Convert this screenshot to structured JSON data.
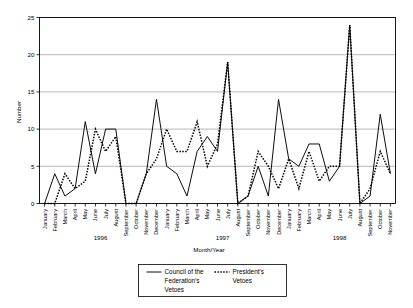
{
  "chart_data": {
    "type": "line",
    "title": "",
    "xlabel": "Month/Year",
    "ylabel": "Number",
    "ylim": [
      0,
      25
    ],
    "yticks": [
      0,
      5,
      10,
      15,
      20,
      25
    ],
    "grid": true,
    "legend_position": "bottom",
    "x": [
      "January 1996",
      "February 1996",
      "March 1996",
      "April 1996",
      "May 1996",
      "June 1996",
      "July 1996",
      "August 1996",
      "September 1996",
      "October 1996",
      "November 1996",
      "December 1996",
      "January 1997",
      "February 1997",
      "March 1997",
      "April 1997",
      "May 1997",
      "June 1997",
      "July 1997",
      "August 1997",
      "September 1997",
      "October 1997",
      "November 1997",
      "December 1997",
      "January 1998",
      "February 1998",
      "March 1998",
      "April 1998",
      "May 1998",
      "June 1998",
      "July 1998",
      "August 1998",
      "September 1998",
      "October 1998",
      "November 1998"
    ],
    "month_labels": [
      "January",
      "February",
      "March",
      "April",
      "May",
      "June",
      "July",
      "August",
      "September",
      "October",
      "November",
      "December",
      "January",
      "February",
      "March",
      "April",
      "May",
      "June",
      "July",
      "August",
      "September",
      "October",
      "November",
      "December",
      "January",
      "February",
      "March",
      "April",
      "May",
      "June",
      "July",
      "August",
      "September",
      "October",
      "November"
    ],
    "year_groups": [
      {
        "label": "1996",
        "start_index": 0,
        "end_index": 11
      },
      {
        "label": "1997",
        "start_index": 12,
        "end_index": 23
      },
      {
        "label": "1998",
        "start_index": 24,
        "end_index": 34
      }
    ],
    "series": [
      {
        "name": "Council of the Federation's Vetoes",
        "style": "solid",
        "color": "#000000",
        "values": [
          0,
          4,
          1,
          2,
          11,
          4,
          10,
          10,
          0,
          0,
          4,
          14,
          5,
          4,
          1,
          7,
          9,
          7,
          19,
          0,
          1,
          5,
          1,
          14,
          6,
          5,
          8,
          8,
          3,
          5,
          24,
          0,
          1,
          12,
          4
        ]
      },
      {
        "name": "President's Vetoes",
        "style": "dotted",
        "color": "#000000",
        "values": [
          0,
          0,
          4,
          2,
          3,
          10,
          7,
          9,
          0,
          0,
          4,
          6,
          10,
          7,
          7,
          11,
          5,
          8,
          19,
          0,
          1,
          7,
          5,
          2,
          6,
          2,
          7,
          3,
          5,
          5,
          24,
          0,
          2,
          7,
          4
        ]
      }
    ],
    "legend": [
      {
        "label": "Council of the Federation's Vetoes",
        "style": "solid"
      },
      {
        "label": "President's Vetoes",
        "style": "dotted"
      }
    ]
  }
}
